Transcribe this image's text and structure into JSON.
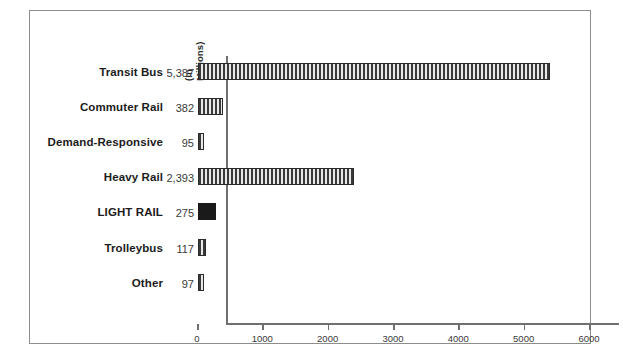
{
  "chart_data": {
    "type": "bar",
    "orientation": "horizontal",
    "title": "",
    "units_note_line1": "(In",
    "units_note_line2": "Millions)",
    "xlabel": "",
    "ylabel": "",
    "xlim": [
      0,
      6000
    ],
    "xticks": [
      0,
      1000,
      2000,
      3000,
      4000,
      5000,
      6000
    ],
    "xtick_labels": [
      "0",
      "1000",
      "2000",
      "3000",
      "4000",
      "5000",
      "6000"
    ],
    "grid": false,
    "legend": false,
    "categories": [
      "Transit Bus",
      "Commuter Rail",
      "Demand-Responsive",
      "Heavy Rail",
      "LIGHT RAIL",
      "Trolleybus",
      "Other"
    ],
    "values": [
      5387,
      382,
      95,
      2393,
      275,
      117,
      97
    ],
    "value_labels": [
      "5,387",
      "382",
      "95",
      "2,393",
      "275",
      "117",
      "97"
    ],
    "highlight_category": "LIGHT RAIL",
    "bar_style_default": "vertical-hatch",
    "bar_style_highlight": "solid-black",
    "colors": {
      "bar_outline": "#2a2a2a",
      "bar_hatch_dark": "#3a3a3a",
      "bar_hatch_light": "#e8e8e8",
      "bar_highlight_fill": "#1a1a1a",
      "axis": "#6f6f6f",
      "frame": "#8d8d8d",
      "background": "#ffffff",
      "label_text": "#1c1c1c",
      "value_text": "#3a3a3a"
    }
  }
}
